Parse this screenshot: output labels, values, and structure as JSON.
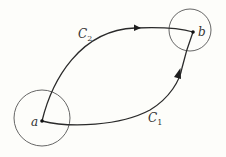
{
  "diagram": {
    "background": "#fdfdfa",
    "stroke_color": "#2a2a2a",
    "circle_color": "#555555",
    "points": {
      "a": {
        "label": "a",
        "x": 42,
        "y": 121
      },
      "b": {
        "label": "b",
        "x": 193,
        "y": 32
      }
    },
    "neighborhoods": {
      "a": {
        "cx": 42,
        "cy": 118,
        "r": 28
      },
      "b": {
        "cx": 190,
        "cy": 30,
        "r": 21
      }
    },
    "curves": {
      "c1": {
        "label": "C",
        "subscript": "1",
        "direction": "a-to-b"
      },
      "c2": {
        "label": "C",
        "subscript": "2",
        "direction": "a-to-b"
      }
    }
  }
}
